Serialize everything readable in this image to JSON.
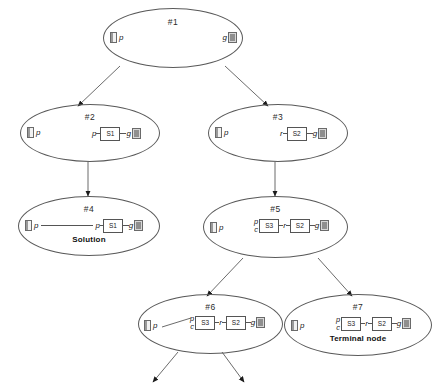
{
  "diagram": {
    "type": "search-tree",
    "title": "",
    "nodes": [
      {
        "id": "n1",
        "label": "#1",
        "note": "",
        "left_item": {
          "icon": "card-pictogram",
          "literal": "p"
        },
        "right_item": {
          "literal": "g",
          "icon": "goal-pictogram"
        },
        "chain": []
      },
      {
        "id": "n2",
        "label": "#2",
        "note": "",
        "left_item": {
          "icon": "card-pictogram",
          "literal": "p"
        },
        "right_item": {
          "literal": "g",
          "icon": "goal-pictogram"
        },
        "chain": [
          {
            "kind": "literal",
            "text": "p"
          },
          {
            "kind": "link"
          },
          {
            "kind": "box",
            "text": "S1"
          },
          {
            "kind": "link"
          }
        ]
      },
      {
        "id": "n3",
        "label": "#3",
        "note": "",
        "left_item": {
          "icon": "card-pictogram",
          "literal": "p"
        },
        "right_item": {
          "literal": "g",
          "icon": "goal-pictogram"
        },
        "chain": [
          {
            "kind": "literal",
            "text": "r"
          },
          {
            "kind": "link"
          },
          {
            "kind": "box",
            "text": "S2"
          },
          {
            "kind": "link"
          }
        ]
      },
      {
        "id": "n4",
        "label": "#4",
        "note": "Solution",
        "left_item": {
          "icon": "card-pictogram",
          "literal": "p"
        },
        "right_item": {
          "literal": "g",
          "icon": "goal-pictogram"
        },
        "chain": [
          {
            "kind": "longlink"
          },
          {
            "kind": "literal",
            "text": "p"
          },
          {
            "kind": "link"
          },
          {
            "kind": "box",
            "text": "S1"
          },
          {
            "kind": "link"
          }
        ]
      },
      {
        "id": "n5",
        "label": "#5",
        "note": "",
        "left_item": {
          "icon": "card-pictogram",
          "literal": "p"
        },
        "right_item": {
          "literal": "g",
          "icon": "goal-pictogram"
        },
        "chain": [
          {
            "kind": "stack",
            "top": "p",
            "bottom": "c"
          },
          {
            "kind": "box",
            "text": "S3"
          },
          {
            "kind": "link"
          },
          {
            "kind": "literal",
            "text": "r"
          },
          {
            "kind": "link"
          },
          {
            "kind": "box",
            "text": "S2"
          },
          {
            "kind": "link"
          }
        ]
      },
      {
        "id": "n6",
        "label": "#6",
        "note": "",
        "left_item": {
          "icon": "card-pictogram",
          "literal": "p"
        },
        "right_item": {
          "literal": "g",
          "icon": "goal-pictogram"
        },
        "chain": [
          {
            "kind": "diaglink"
          },
          {
            "kind": "stack",
            "top": "p",
            "bottom": "c"
          },
          {
            "kind": "box",
            "text": "S3"
          },
          {
            "kind": "link"
          },
          {
            "kind": "literal",
            "text": "r"
          },
          {
            "kind": "link"
          },
          {
            "kind": "box",
            "text": "S2"
          },
          {
            "kind": "link"
          }
        ]
      },
      {
        "id": "n7",
        "label": "#7",
        "note": "Terminal node",
        "left_item": {
          "icon": "card-pictogram",
          "literal": "p"
        },
        "right_item": {
          "literal": "g",
          "icon": "goal-pictogram"
        },
        "chain": [
          {
            "kind": "stack",
            "top": "p",
            "bottom": "c"
          },
          {
            "kind": "box",
            "text": "S3"
          },
          {
            "kind": "link"
          },
          {
            "kind": "literal",
            "text": "r"
          },
          {
            "kind": "link"
          },
          {
            "kind": "box",
            "text": "S2"
          },
          {
            "kind": "link"
          }
        ]
      }
    ],
    "edges": [
      {
        "from": "#1",
        "to": "#2"
      },
      {
        "from": "#1",
        "to": "#3"
      },
      {
        "from": "#2",
        "to": "#4"
      },
      {
        "from": "#3",
        "to": "#5"
      },
      {
        "from": "#5",
        "to": "#6"
      },
      {
        "from": "#5",
        "to": "#7"
      },
      {
        "from": "#6",
        "to": "open-left"
      },
      {
        "from": "#6",
        "to": "open-right"
      }
    ],
    "colors": {
      "stroke": "#5a5a5a",
      "text": "#222222",
      "background": "#ffffff"
    }
  }
}
